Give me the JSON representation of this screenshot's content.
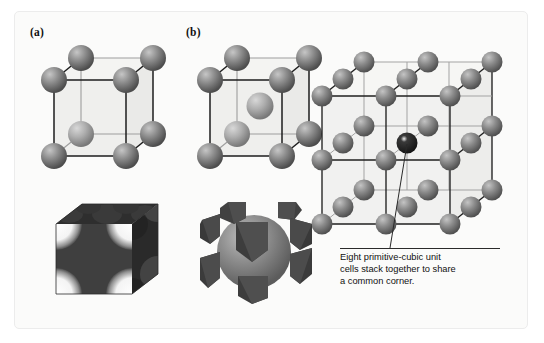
{
  "figure": {
    "background": "#fbfbfa",
    "border_color": "#ececec"
  },
  "panels": [
    {
      "id": "a",
      "label": "(a)",
      "type": "primitive-cubic-unit-cell",
      "description": "Primitive (simple) cubic unit cell with eight corner spheres",
      "sphere_count": 8,
      "center_sphere": false
    },
    {
      "id": "b",
      "label": "(b)",
      "type": "body-centered-cubic-unit-cell",
      "description": "Body-centered cubic unit cell with eight corner spheres and one central sphere",
      "sphere_count": 9,
      "center_sphere": true
    }
  ],
  "lattice": {
    "name": "stacked-primitive-cubic-lattice",
    "description": "Eight primitive cubic cells stacked 2x2x2 sharing one common corner atom",
    "grid": 3,
    "highlighted_atom": "shared-common-corner"
  },
  "cutaways": [
    {
      "id": "cutaway-primitive",
      "name": "primitive-cubic-cutaway",
      "description": "Dark cube with concave spherical cut-outs at the eight corners"
    },
    {
      "id": "cutaway-body-centered",
      "name": "body-centered-cubic-cutaway",
      "description": "Eight corner wedges surrounding a large central sphere"
    }
  ],
  "annotation": {
    "lines": [
      "Eight primitive-cubic unit",
      "cells stack together to share",
      "a common corner."
    ],
    "leader_line": true
  },
  "colors": {
    "sphere_front": "#8a8a8a",
    "sphere_back": "#a8a8a8",
    "sphere_highlight": "#c8c8c8",
    "sphere_shadow": "#5a5a5a",
    "edge_front": "#1d1d1d",
    "edge_back": "#9a9a9a",
    "face_tint": "#ededea",
    "cutaway_dark": "#3a3a3a",
    "cutaway_mid": "#4f4f4f",
    "cutaway_sphere": "#8d8d8d",
    "text": "#111111"
  }
}
